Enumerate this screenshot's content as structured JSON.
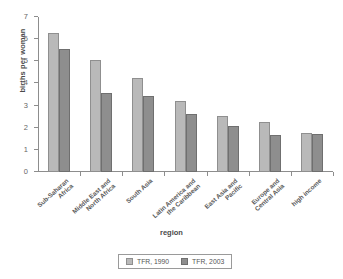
{
  "chart_data": {
    "type": "bar",
    "title": "",
    "xlabel": "region",
    "ylabel": "births per woman",
    "ylim": [
      0,
      7
    ],
    "yticks": [
      0,
      1,
      2,
      3,
      4,
      5,
      6,
      7
    ],
    "grid": false,
    "legend_position": "bottom",
    "categories": [
      "Sub-Saharan\nAfrica",
      "Middle East and\nNorth Africa",
      "South Asia",
      "Latin America and\nthe Caribbean",
      "East Asia and\nPacific",
      "Europe and\nCentral Asia",
      "high income"
    ],
    "series": [
      {
        "name": "TFR, 1990",
        "color": "#b9b9b9",
        "values": [
          6.3,
          5.05,
          4.25,
          3.2,
          2.55,
          2.25,
          1.75
        ]
      },
      {
        "name": "TFR, 2003",
        "color": "#8e8e8e",
        "values": [
          5.55,
          3.55,
          3.45,
          2.6,
          2.1,
          1.65,
          1.7
        ]
      }
    ]
  },
  "legend": {
    "items": [
      {
        "label": "TFR, 1990"
      },
      {
        "label": "TFR, 2003"
      }
    ]
  }
}
